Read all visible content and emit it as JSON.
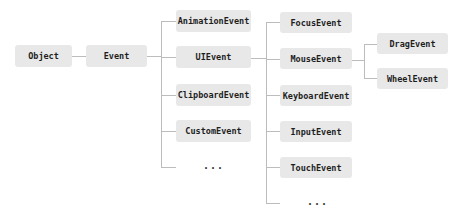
{
  "diagram": {
    "nodes": {
      "object": "Object",
      "event": "Event",
      "animation_event": "AnimationEvent",
      "ui_event": "UIEvent",
      "clipboard_event": "ClipboardEvent",
      "custom_event": "CustomEvent",
      "event_more": "...",
      "focus_event": "FocusEvent",
      "mouse_event": "MouseEvent",
      "keyboard_event": "KeyboardEvent",
      "input_event": "InputEvent",
      "touch_event": "TouchEvent",
      "ui_event_more": "...",
      "drag_event": "DragEvent",
      "wheel_event": "WheelEvent"
    },
    "edges": [
      [
        "Object",
        "Event"
      ],
      [
        "Event",
        "AnimationEvent"
      ],
      [
        "Event",
        "UIEvent"
      ],
      [
        "Event",
        "ClipboardEvent"
      ],
      [
        "Event",
        "CustomEvent"
      ],
      [
        "Event",
        "..."
      ],
      [
        "UIEvent",
        "FocusEvent"
      ],
      [
        "UIEvent",
        "MouseEvent"
      ],
      [
        "UIEvent",
        "KeyboardEvent"
      ],
      [
        "UIEvent",
        "InputEvent"
      ],
      [
        "UIEvent",
        "TouchEvent"
      ],
      [
        "UIEvent",
        "..."
      ],
      [
        "MouseEvent",
        "DragEvent"
      ],
      [
        "MouseEvent",
        "WheelEvent"
      ]
    ],
    "colors": {
      "node_fill": "#e8e8e8",
      "text": "#1e1e1e",
      "connector": "#bcbcbc"
    }
  }
}
